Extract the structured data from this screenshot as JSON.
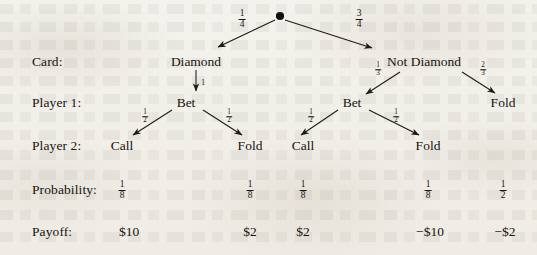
{
  "figure": {
    "type": "game-tree",
    "root_node": "chance-node"
  },
  "row_labels": [
    {
      "id": "card",
      "text": "Card:",
      "x": 32,
      "y": 62
    },
    {
      "id": "player1",
      "text": "Player 1:",
      "x": 32,
      "y": 103
    },
    {
      "id": "player2",
      "text": "Player 2:",
      "x": 32,
      "y": 146
    },
    {
      "id": "probability",
      "text": "Probability:",
      "x": 32,
      "y": 190
    },
    {
      "id": "payoff",
      "text": "Payoff:",
      "x": 32,
      "y": 232
    }
  ],
  "nodes": [
    {
      "id": "card-diamond",
      "label": "Diamond",
      "x": 196,
      "y": 62
    },
    {
      "id": "card-not-diamond",
      "label": "Not Diamond",
      "x": 424,
      "y": 62
    },
    {
      "id": "p1-bet-left",
      "label": "Bet",
      "x": 186,
      "y": 103
    },
    {
      "id": "p1-bet-right",
      "label": "Bet",
      "x": 352,
      "y": 103
    },
    {
      "id": "p1-fold-right",
      "label": "Fold",
      "x": 503,
      "y": 103
    },
    {
      "id": "p2-call-1",
      "label": "Call",
      "x": 122,
      "y": 146
    },
    {
      "id": "p2-fold-1",
      "label": "Fold",
      "x": 250,
      "y": 146
    },
    {
      "id": "p2-call-2",
      "label": "Call",
      "x": 303,
      "y": 146
    },
    {
      "id": "p2-fold-2",
      "label": "Fold",
      "x": 428,
      "y": 146
    }
  ],
  "edge_labels": [
    {
      "id": "chance-diamond-prob",
      "num": "1",
      "den": "4",
      "x": 242,
      "y": 19
    },
    {
      "id": "chance-not-diamond-prob",
      "num": "3",
      "den": "4",
      "x": 359,
      "y": 19
    },
    {
      "id": "diamond-bet-prob",
      "text": "1",
      "x": 203,
      "y": 82
    },
    {
      "id": "not-diamond-bet-prob",
      "num": "1",
      "den": "3",
      "x": 378,
      "y": 70
    },
    {
      "id": "not-diamond-fold-prob",
      "num": "2",
      "den": "3",
      "x": 483,
      "y": 70
    },
    {
      "id": "bet-left-call-prob",
      "num": "1",
      "den": "2",
      "x": 145,
      "y": 117
    },
    {
      "id": "bet-left-fold-prob",
      "num": "1",
      "den": "2",
      "x": 229,
      "y": 117
    },
    {
      "id": "bet-right-call-prob",
      "num": "1",
      "den": "2",
      "x": 311,
      "y": 117
    },
    {
      "id": "bet-right-fold-prob",
      "num": "1",
      "den": "2",
      "x": 396,
      "y": 117
    }
  ],
  "probabilities": [
    {
      "id": "prob-1",
      "num": "1",
      "den": "8",
      "x": 122,
      "y": 190
    },
    {
      "id": "prob-2",
      "num": "1",
      "den": "8",
      "x": 250,
      "y": 190
    },
    {
      "id": "prob-3",
      "num": "1",
      "den": "8",
      "x": 303,
      "y": 190
    },
    {
      "id": "prob-4",
      "num": "1",
      "den": "8",
      "x": 428,
      "y": 190
    },
    {
      "id": "prob-5",
      "num": "1",
      "den": "2",
      "x": 503,
      "y": 190
    }
  ],
  "payoffs": [
    {
      "id": "payoff-1",
      "value": "$10",
      "x": 129,
      "y": 232
    },
    {
      "id": "payoff-2",
      "value": "$2",
      "x": 250,
      "y": 232
    },
    {
      "id": "payoff-3",
      "value": "$2",
      "x": 303,
      "y": 232
    },
    {
      "id": "payoff-4",
      "value": "−$10",
      "x": 430,
      "y": 232
    },
    {
      "id": "payoff-5",
      "value": "−$2",
      "x": 505,
      "y": 232
    }
  ],
  "colors": {
    "ink": "#17140f",
    "paper": "#f3f1ec"
  }
}
